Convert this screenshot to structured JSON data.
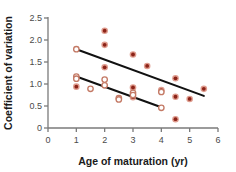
{
  "chart_data": {
    "type": "scatter",
    "title": "",
    "xlabel": "Age of maturation (yr)",
    "ylabel": "Coefficient of variation",
    "xlim": [
      0,
      6
    ],
    "ylim": [
      0,
      2.5
    ],
    "xticks": [
      0,
      1,
      2,
      3,
      4,
      5,
      6
    ],
    "xtick_labels": [
      "0",
      "1",
      "2",
      "3",
      "4",
      "5",
      "6"
    ],
    "yticks": [
      0,
      0.5,
      1.0,
      1.5,
      2.0,
      2.5
    ],
    "ytick_labels": [
      "0",
      "0.5",
      "1.0",
      "1.5",
      "2.0",
      "2.5"
    ],
    "grid": false,
    "legend": "none",
    "colors": {
      "marker_fill": "#8c2318",
      "marker_ring": "#d98b7a",
      "open_marker_edge": "#c47a66",
      "trendline": "#111111",
      "axis": "#7a7a7a",
      "tick_text": "#4a4a4a",
      "title_text": "#1a1a1a",
      "background": "#ffffff"
    },
    "series": [
      {
        "name": "filled",
        "marker": "filled-circle",
        "points": [
          {
            "x": 1.0,
            "y": 0.94
          },
          {
            "x": 2.0,
            "y": 2.21
          },
          {
            "x": 2.0,
            "y": 1.89
          },
          {
            "x": 2.0,
            "y": 1.38
          },
          {
            "x": 3.0,
            "y": 1.67
          },
          {
            "x": 3.0,
            "y": 0.92
          },
          {
            "x": 3.0,
            "y": 0.7
          },
          {
            "x": 3.5,
            "y": 1.41
          },
          {
            "x": 4.0,
            "y": 0.86
          },
          {
            "x": 4.5,
            "y": 1.13
          },
          {
            "x": 4.5,
            "y": 0.71
          },
          {
            "x": 4.5,
            "y": 0.2
          },
          {
            "x": 5.0,
            "y": 0.66
          },
          {
            "x": 5.5,
            "y": 0.89
          }
        ]
      },
      {
        "name": "open",
        "marker": "open-circle",
        "points": [
          {
            "x": 1.0,
            "y": 1.79
          },
          {
            "x": 1.0,
            "y": 1.17
          },
          {
            "x": 1.0,
            "y": 1.12
          },
          {
            "x": 1.5,
            "y": 0.89
          },
          {
            "x": 2.0,
            "y": 1.1
          },
          {
            "x": 2.0,
            "y": 0.97
          },
          {
            "x": 2.5,
            "y": 0.68
          },
          {
            "x": 2.5,
            "y": 0.65
          },
          {
            "x": 3.0,
            "y": 0.8
          },
          {
            "x": 3.0,
            "y": 0.75
          },
          {
            "x": 4.0,
            "y": 0.82
          },
          {
            "x": 4.0,
            "y": 0.46
          }
        ]
      }
    ],
    "trendlines": [
      {
        "name": "upper-trendline",
        "x1": 1.0,
        "y1": 1.79,
        "x2": 5.5,
        "y2": 0.73
      },
      {
        "name": "lower-trendline",
        "x1": 1.0,
        "y1": 1.17,
        "x2": 4.0,
        "y2": 0.47
      }
    ]
  }
}
